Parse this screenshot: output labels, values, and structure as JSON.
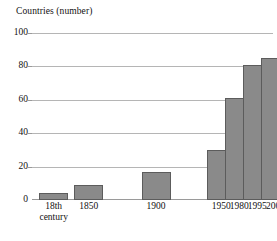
{
  "chart_data": {
    "type": "bar",
    "title": "",
    "ylabel": "Countries (number)",
    "xlabel": "",
    "categories": [
      "18th century",
      "1850",
      "1900",
      "1950",
      "1980",
      "1995",
      "2005"
    ],
    "values": [
      4,
      9,
      17,
      30,
      61,
      81,
      85
    ],
    "ylim": [
      0,
      100
    ],
    "yticks": [
      0,
      20,
      40,
      60,
      80,
      100
    ],
    "ytick_labels": [
      "0",
      "20",
      "40",
      "60",
      "80",
      "100"
    ],
    "grid": true,
    "legend": false,
    "bar_color": "#8a8a8a",
    "bar_border_color": "#5c5c5c",
    "gridline_color": "#b5b5b5",
    "bars": [
      {
        "label_line1": "18th",
        "label_line2": "century",
        "value": 4,
        "x_pct": 3.0,
        "width_pct": 12.0
      },
      {
        "label_line1": "1850",
        "label_line2": "",
        "value": 9,
        "x_pct": 17.5,
        "width_pct": 12.0
      },
      {
        "label_line1": "1900",
        "label_line2": "",
        "value": 17,
        "x_pct": 45.5,
        "width_pct": 12.0
      },
      {
        "label_line1": "1950",
        "label_line2": "",
        "value": 30,
        "x_pct": 72.5,
        "width_pct": 12.0
      },
      {
        "label_line1": "1980",
        "label_line2": "",
        "value": 61,
        "x_pct": 80.0,
        "width_pct": 12.0
      },
      {
        "label_line1": "1995",
        "label_line2": "",
        "value": 81,
        "x_pct": 87.5,
        "width_pct": 12.0
      },
      {
        "label_line1": "2005",
        "label_line2": "",
        "value": 85,
        "x_pct": 95.0,
        "width_pct": 12.0
      }
    ]
  }
}
